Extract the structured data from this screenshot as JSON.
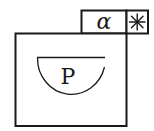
{
  "diagram": {
    "stroke_color": "#1a1a1a",
    "background": "#ffffff",
    "tab": {
      "label": "α",
      "marker": "∗",
      "marker_name": "asterisk-icon"
    },
    "main_box": {
      "inner_shape": "half-circle",
      "inner_label": "P"
    }
  }
}
